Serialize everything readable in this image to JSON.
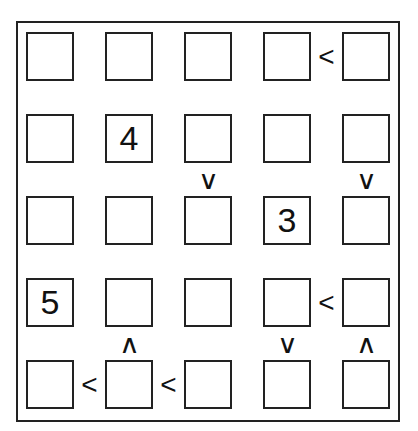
{
  "puzzle": {
    "type": "futoshiki",
    "size": 5,
    "grid": [
      [
        "",
        "",
        "",
        "",
        ""
      ],
      [
        "",
        "4",
        "",
        "",
        ""
      ],
      [
        "",
        "",
        "",
        "3",
        ""
      ],
      [
        "5",
        "",
        "",
        "",
        ""
      ],
      [
        "",
        "",
        "",
        "",
        ""
      ]
    ],
    "horizontal_constraints": [
      {
        "row": 0,
        "between_cols": [
          3,
          4
        ],
        "symbol": "<"
      },
      {
        "row": 3,
        "between_cols": [
          3,
          4
        ],
        "symbol": "<"
      },
      {
        "row": 4,
        "between_cols": [
          0,
          1
        ],
        "symbol": "<"
      },
      {
        "row": 4,
        "between_cols": [
          1,
          2
        ],
        "symbol": "<"
      }
    ],
    "vertical_constraints": [
      {
        "col": 2,
        "between_rows": [
          1,
          2
        ],
        "symbol": "v"
      },
      {
        "col": 4,
        "between_rows": [
          1,
          2
        ],
        "symbol": "v"
      },
      {
        "col": 1,
        "between_rows": [
          3,
          4
        ],
        "symbol": "^"
      },
      {
        "col": 3,
        "between_rows": [
          3,
          4
        ],
        "symbol": "v"
      },
      {
        "col": 4,
        "between_rows": [
          3,
          4
        ],
        "symbol": "^"
      }
    ]
  },
  "colors": {
    "line": "#222222",
    "text": "#111111",
    "background": "#ffffff"
  }
}
